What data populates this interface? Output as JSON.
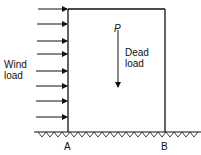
{
  "diagram": {
    "labels": {
      "wind_load_line1": "Wind",
      "wind_load_line2": "load",
      "force_symbol": "P",
      "dead_load_line1": "Dead",
      "dead_load_line2": "load",
      "support_a": "A",
      "support_b": "B"
    },
    "wind_arrow_count": 8,
    "colors": {
      "stroke": "#111111",
      "background": "#ffffff"
    }
  }
}
